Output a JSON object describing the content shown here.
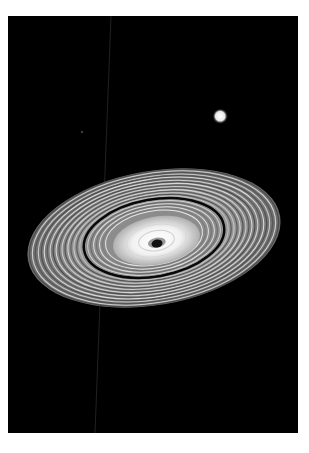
{
  "image": {
    "description": "Planetary ring system viewed at an oblique angle against black space, with a bright moon/star in the upper right",
    "background_color": "#000000",
    "border_color": "#ffffff",
    "elements": {
      "rings": {
        "center": [
          146,
          222
        ],
        "outer_rx": 128,
        "outer_ry": 67,
        "rotation_deg": -10,
        "gap_rx": 71,
        "gap_ry": 40
      },
      "bright_body": {
        "center": [
          213,
          101
        ],
        "radius": 6
      },
      "faint_streak": {
        "from": [
          103,
          0
        ],
        "to": [
          87,
          417
        ]
      },
      "speck": {
        "center": [
          74,
          116
        ]
      }
    }
  }
}
